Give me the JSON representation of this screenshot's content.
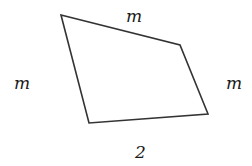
{
  "diagram": {
    "type": "quadrilateral",
    "vertices": [
      [
        61,
        15
      ],
      [
        180,
        45
      ],
      [
        208,
        114
      ],
      [
        89,
        123
      ]
    ],
    "stroke_color": "#333333",
    "labels": {
      "top": "m",
      "left": "m",
      "right": "m",
      "bottom": "2"
    }
  }
}
